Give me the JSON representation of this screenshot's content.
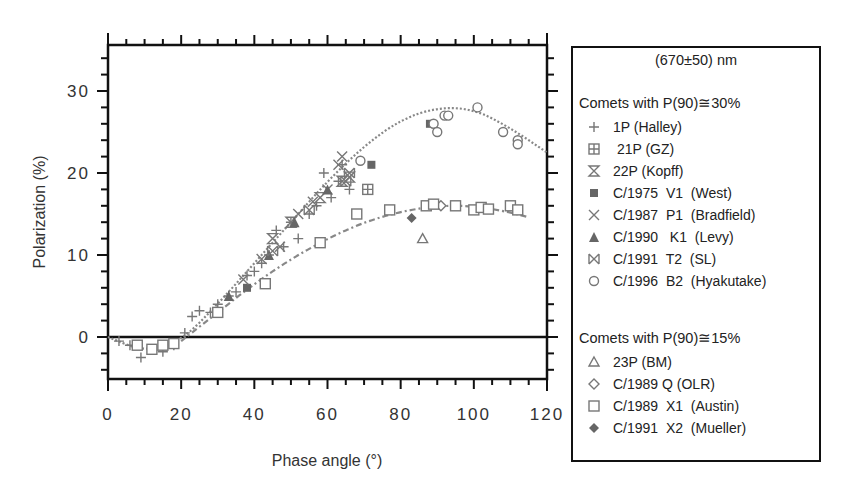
{
  "chart_data": {
    "type": "scatter",
    "title": "",
    "xlabel": "Phase angle (°)",
    "ylabel": "Polarization (%)",
    "xlim": [
      0,
      120
    ],
    "ylim": [
      -5,
      35
    ],
    "xticks": [
      0,
      20,
      40,
      60,
      80,
      100,
      120
    ],
    "yticks": [
      0,
      10,
      20,
      30
    ],
    "grid": false,
    "legend_position": "right (outside)",
    "legend_title": "(670±50)  nm",
    "groups": [
      {
        "name": "Comets with P(90)≅30%",
        "fit_curve": {
          "style": "dotted",
          "points": [
            [
              0,
              0
            ],
            [
              10,
              -1.8
            ],
            [
              20,
              -0.5
            ],
            [
              30,
              4
            ],
            [
              40,
              9
            ],
            [
              50,
              14
            ],
            [
              60,
              19
            ],
            [
              70,
              23.3
            ],
            [
              80,
              26.5
            ],
            [
              90,
              28
            ],
            [
              100,
              27.8
            ],
            [
              110,
              25.5
            ],
            [
              120,
              22.5
            ]
          ]
        },
        "series": [
          {
            "name": "1P (Halley)",
            "marker": "plus",
            "values": [
              [
                3,
                -0.5
              ],
              [
                6,
                -1
              ],
              [
                9,
                -2.5
              ],
              [
                12,
                -1.5
              ],
              [
                15,
                -1.8
              ],
              [
                18,
                -1
              ],
              [
                21,
                0.5
              ],
              [
                23,
                2.5
              ],
              [
                25,
                3.2
              ],
              [
                28,
                3
              ],
              [
                30,
                4
              ],
              [
                33,
                5
              ],
              [
                35,
                5.5
              ],
              [
                38,
                7.5
              ],
              [
                40,
                8
              ],
              [
                42,
                9
              ],
              [
                44,
                10
              ],
              [
                46,
                13
              ],
              [
                48,
                11
              ],
              [
                50,
                14
              ],
              [
                52,
                12
              ],
              [
                55,
                15
              ],
              [
                57,
                16
              ],
              [
                59,
                20
              ],
              [
                61,
                17
              ],
              [
                63,
                19
              ],
              [
                64,
                21
              ],
              [
                66,
                18
              ]
            ]
          },
          {
            "name": "21P (GZ)",
            "marker": "square-plus",
            "values": [
              [
                71,
                18
              ]
            ]
          },
          {
            "name": "22P (Kopff)",
            "marker": "hourglass",
            "values": [
              [
                45,
                12
              ],
              [
                50,
                14
              ],
              [
                58,
                17
              ],
              [
                64,
                19
              ],
              [
                66,
                19.5
              ]
            ]
          },
          {
            "name": "C/1975 V1 (West)",
            "marker": "filled-square",
            "values": [
              [
                38,
                6
              ],
              [
                72,
                21
              ],
              [
                88,
                26
              ]
            ]
          },
          {
            "name": "C/1987 P1 (Bradfield)",
            "marker": "x",
            "values": [
              [
                37,
                7
              ],
              [
                42,
                9.5
              ],
              [
                47,
                11
              ],
              [
                52,
                15
              ],
              [
                56,
                16.5
              ],
              [
                60,
                18
              ],
              [
                63,
                21
              ],
              [
                64,
                22
              ]
            ]
          },
          {
            "name": "C/1990 K1 (Levy)",
            "marker": "filled-triangle",
            "values": [
              [
                33,
                5
              ],
              [
                44,
                10
              ],
              [
                51,
                14
              ],
              [
                60,
                18
              ]
            ]
          },
          {
            "name": "C/1991 T2 (SL)",
            "marker": "boxed-x",
            "values": [
              [
                45,
                10.5
              ],
              [
                55,
                15.5
              ],
              [
                65,
                19
              ],
              [
                66,
                20
              ]
            ]
          },
          {
            "name": "C/1996 B2 (Hyakutake)",
            "marker": "circle",
            "values": [
              [
                69,
                21.5
              ],
              [
                89,
                26
              ],
              [
                90,
                25
              ],
              [
                92,
                27
              ],
              [
                93,
                27
              ],
              [
                101,
                28
              ],
              [
                108,
                25
              ],
              [
                112,
                24
              ],
              [
                112,
                23.5
              ]
            ]
          }
        ]
      },
      {
        "name": "Comets with P(90)≅15%",
        "fit_curve": {
          "style": "dash-dot",
          "points": [
            [
              20,
              -0.5
            ],
            [
              30,
              3
            ],
            [
              40,
              6.5
            ],
            [
              50,
              9.5
            ],
            [
              60,
              12
            ],
            [
              70,
              14
            ],
            [
              80,
              15.3
            ],
            [
              90,
              16
            ],
            [
              100,
              16
            ],
            [
              110,
              15.2
            ],
            [
              115,
              14.6
            ]
          ]
        },
        "series": [
          {
            "name": "23P (BM)",
            "marker": "triangle",
            "values": [
              [
                86,
                12
              ]
            ]
          },
          {
            "name": "C/1989 Q (OLR)",
            "marker": "diamond",
            "values": [
              [
                91,
                16
              ]
            ]
          },
          {
            "name": "C/1989 X1 (Austin)",
            "marker": "square",
            "values": [
              [
                8,
                -1
              ],
              [
                12,
                -1.5
              ],
              [
                15,
                -1
              ],
              [
                18,
                -0.8
              ],
              [
                30,
                3
              ],
              [
                43,
                6.5
              ],
              [
                58,
                11.5
              ],
              [
                68,
                15
              ],
              [
                77,
                15.5
              ],
              [
                87,
                16
              ],
              [
                89,
                16.2
              ],
              [
                95,
                16
              ],
              [
                100,
                15.5
              ],
              [
                102,
                15.8
              ],
              [
                104,
                15.6
              ],
              [
                110,
                16
              ],
              [
                112,
                15.5
              ]
            ]
          },
          {
            "name": "C/1991 X2 (Mueller)",
            "marker": "filled-diamond",
            "values": [
              [
                83,
                14.5
              ]
            ]
          }
        ]
      }
    ]
  },
  "axes": {
    "x_label": "Phase angle (°)",
    "y_label": "Polarization (%)",
    "x_tick_labels": [
      "0",
      "20",
      "40",
      "60",
      "80",
      "100",
      "120"
    ],
    "y_tick_labels": [
      "0",
      "10",
      "20",
      "30"
    ]
  },
  "legend": {
    "title": "(670±50)  nm",
    "groups": [
      {
        "title": "Comets with P(90)≅30%",
        "items": [
          {
            "label": "1P (Halley)",
            "icon": "plus-icon"
          },
          {
            "label": " 21P (GZ)",
            "icon": "square-plus-icon"
          },
          {
            "label": "22P (Kopff)",
            "icon": "hourglass-icon"
          },
          {
            "label": "C/1975  V1  (West)",
            "icon": "filled-square-icon"
          },
          {
            "label": "C/1987  P1  (Bradfield)",
            "icon": "x-icon"
          },
          {
            "label": "C/1990   K1  (Levy)",
            "icon": "filled-triangle-icon"
          },
          {
            "label": "C/1991  T2  (SL)",
            "icon": "boxed-x-icon"
          },
          {
            "label": "C/1996  B2  (Hyakutake)",
            "icon": "circle-icon"
          }
        ]
      },
      {
        "title": "Comets with P(90)≅15%",
        "items": [
          {
            "label": "23P (BM)",
            "icon": "triangle-icon"
          },
          {
            "label": "C/1989 Q (OLR)",
            "icon": "diamond-icon"
          },
          {
            "label": "C/1989  X1  (Austin)",
            "icon": "square-icon"
          },
          {
            "label": "C/1991  X2  (Mueller)",
            "icon": "filled-diamond-icon"
          }
        ]
      }
    ]
  },
  "colors": {
    "axis": "#111111",
    "marker": "#777777",
    "marker_dark": "#666666",
    "text": "#333333"
  }
}
